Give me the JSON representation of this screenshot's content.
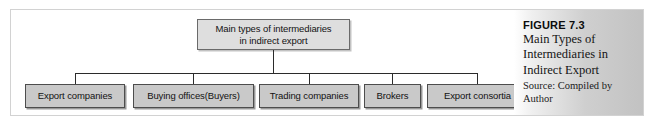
{
  "figure": {
    "number_label": "FIGURE 7.3",
    "title_lines": [
      "Main Types of",
      "Intermediaries in",
      "Indirect Export"
    ],
    "source_lines": [
      "Source: Compiled by",
      "Author"
    ]
  },
  "diagram": {
    "type": "org-chart",
    "root": {
      "lines": [
        "Main types of intermediaries",
        "in indirect export"
      ]
    },
    "leaves": [
      {
        "label": "Export companies"
      },
      {
        "label": "Buying offices(Buyers)"
      },
      {
        "label": "Trading companies"
      },
      {
        "label": "Brokers"
      },
      {
        "label": "Export consortia"
      }
    ]
  },
  "colors": {
    "leaf_fill": "#c9c9c9",
    "root_fill": "#dedede",
    "connector": "#2b2b2b",
    "frame_border": "#d2d2d2"
  }
}
